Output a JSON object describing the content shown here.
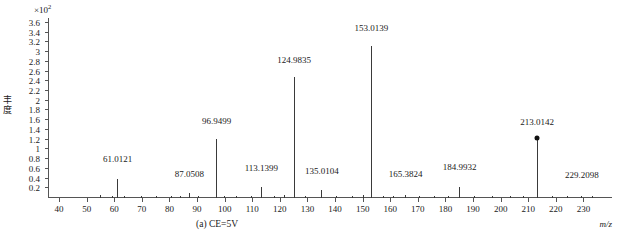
{
  "figure": {
    "caption": "(a) CE=5V",
    "y_axis_title_chars": [
      "丰",
      "度"
    ],
    "y_axis_exponent_prefix": "×10",
    "y_axis_exponent_power": "2",
    "x_axis_title": "m/z"
  },
  "chart_data": {
    "type": "bar",
    "title": "",
    "subtitle": "",
    "xlabel": "m/z",
    "ylabel": "丰度",
    "y_scale_factor": "×10²",
    "xlim": [
      36,
      236
    ],
    "ylim": [
      0,
      3.7
    ],
    "xticks": [
      40,
      50,
      60,
      70,
      80,
      90,
      100,
      110,
      120,
      130,
      140,
      150,
      160,
      170,
      180,
      190,
      200,
      210,
      220,
      230
    ],
    "yticks": [
      0.2,
      0.4,
      0.6,
      0.8,
      1,
      1.2,
      1.4,
      1.6,
      1.8,
      2,
      2.2,
      2.4,
      2.6,
      2.8,
      3,
      3.2,
      3.4,
      3.6
    ],
    "ytick_labels": [
      "0.2",
      "0.4",
      "0.6",
      "0.8",
      "1",
      "1.2",
      "1.4",
      "1.6",
      "1.8",
      "2",
      "2.2",
      "2.4",
      "2.6",
      "2.8",
      "3",
      "3.2",
      "3.4",
      "3.6"
    ],
    "grid": false,
    "legend": "none",
    "annotation": "(a) CE=5V",
    "labeled_peaks": [
      {
        "mz": "61.0121",
        "x": 61.0121,
        "y": 0.4,
        "label_dy": 0.3,
        "marker": false
      },
      {
        "mz": "87.0508",
        "x": 87.0508,
        "y": 0.1,
        "label_dy": 0.3,
        "marker": false
      },
      {
        "mz": "96.9499",
        "x": 96.9499,
        "y": 1.22,
        "label_dy": 0.26,
        "marker": false
      },
      {
        "mz": "113.1399",
        "x": 113.1399,
        "y": 0.22,
        "label_dy": 0.3,
        "marker": false
      },
      {
        "mz": "124.9835",
        "x": 124.9835,
        "y": 2.48,
        "label_dy": 0.26,
        "marker": false
      },
      {
        "mz": "135.0104",
        "x": 135.0104,
        "y": 0.16,
        "label_dy": 0.3,
        "marker": false
      },
      {
        "mz": "153.0139",
        "x": 153.0139,
        "y": 3.13,
        "label_dy": 0.26,
        "marker": false
      },
      {
        "mz": "165.3824",
        "x": 165.3824,
        "y": 0.06,
        "label_dy": 0.34,
        "marker": false
      },
      {
        "mz": "184.9932",
        "x": 184.9932,
        "y": 0.23,
        "label_dy": 0.3,
        "marker": false
      },
      {
        "mz": "213.0142",
        "x": 213.0142,
        "y": 1.19,
        "label_dy": 0.28,
        "marker": true
      },
      {
        "mz": "229.2098",
        "x": 229.2098,
        "y": 0.04,
        "label_dy": 0.34,
        "marker": false
      }
    ],
    "minor_peaks": [
      {
        "x": 55.0,
        "y": 0.055
      },
      {
        "x": 59.2,
        "y": 0.045
      },
      {
        "x": 63.5,
        "y": 0.04
      },
      {
        "x": 69.8,
        "y": 0.05
      },
      {
        "x": 75.2,
        "y": 0.04
      },
      {
        "x": 80.5,
        "y": 0.05
      },
      {
        "x": 84.0,
        "y": 0.04
      },
      {
        "x": 90.5,
        "y": 0.05
      },
      {
        "x": 99.6,
        "y": 0.045
      },
      {
        "x": 104.0,
        "y": 0.05
      },
      {
        "x": 109.5,
        "y": 0.04
      },
      {
        "x": 118.0,
        "y": 0.05
      },
      {
        "x": 121.5,
        "y": 0.055
      },
      {
        "x": 129.0,
        "y": 0.04
      },
      {
        "x": 140.2,
        "y": 0.05
      },
      {
        "x": 146.0,
        "y": 0.04
      },
      {
        "x": 150.0,
        "y": 0.055
      },
      {
        "x": 157.5,
        "y": 0.05
      },
      {
        "x": 161.0,
        "y": 0.04
      },
      {
        "x": 170.5,
        "y": 0.05
      },
      {
        "x": 176.0,
        "y": 0.04
      },
      {
        "x": 181.0,
        "y": 0.045
      },
      {
        "x": 190.5,
        "y": 0.04
      },
      {
        "x": 197.0,
        "y": 0.05
      },
      {
        "x": 203.5,
        "y": 0.04
      },
      {
        "x": 208.0,
        "y": 0.045
      },
      {
        "x": 218.5,
        "y": 0.04
      },
      {
        "x": 224.0,
        "y": 0.05
      },
      {
        "x": 233.0,
        "y": 0.04
      }
    ]
  }
}
